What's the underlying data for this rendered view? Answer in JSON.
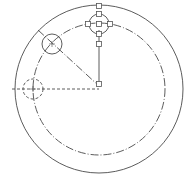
{
  "diagram": {
    "type": "cad-drawing",
    "colors": {
      "stroke": "#4a4a4a",
      "background": "#ffffff",
      "grip": "#555555"
    },
    "center": {
      "x": 99,
      "y": 89
    },
    "outer_circle": {
      "cx": 99,
      "cy": 89,
      "r": 84
    },
    "pitch_circle": {
      "cx": 99,
      "cy": 89,
      "r": 66,
      "style": "dash-dot"
    },
    "holes": [
      {
        "name": "top-hole-selected",
        "cx": 99,
        "cy": 24,
        "r": 10,
        "style": "solid",
        "selected": true
      },
      {
        "name": "upper-left-hole",
        "cx": 52,
        "cy": 44,
        "r": 10,
        "style": "solid",
        "selected": false
      },
      {
        "name": "left-hole-preview",
        "cx": 33,
        "cy": 89,
        "r": 10,
        "style": "dashed",
        "selected": false
      }
    ],
    "lines": [
      {
        "name": "vertical-radius",
        "x1": 99,
        "y1": 30,
        "x2": 99,
        "y2": 84,
        "style": "solid"
      },
      {
        "name": "diagonal-radius",
        "x1": 38,
        "y1": 30,
        "x2": 99,
        "y2": 86,
        "style": "dash-dot"
      },
      {
        "name": "horizontal-radius",
        "x1": 12,
        "y1": 89,
        "x2": 99,
        "y2": 89,
        "style": "dashed"
      }
    ],
    "grips": [
      {
        "x": 99,
        "y": 6
      },
      {
        "x": 99,
        "y": 14
      },
      {
        "x": 88,
        "y": 24
      },
      {
        "x": 99,
        "y": 24
      },
      {
        "x": 110,
        "y": 24
      },
      {
        "x": 99,
        "y": 34
      },
      {
        "x": 99,
        "y": 44
      },
      {
        "x": 99,
        "y": 84
      }
    ]
  }
}
